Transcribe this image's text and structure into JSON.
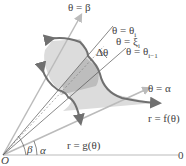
{
  "labels": {
    "theta_beta": "θ = β",
    "theta_i": "θ = θ",
    "theta_i_sub": "i",
    "theta_xi": "θ = ξ",
    "theta_xi_sub": "i",
    "delta_theta": "Δθ",
    "theta_im1": "θ = θ",
    "theta_im1_sub": "i−1",
    "theta_alpha": "θ = α",
    "r_f": "r = f(θ)",
    "r_g": "r = g(θ)",
    "origin": "O",
    "polar_axis": "0",
    "beta": "β",
    "alpha": "α"
  },
  "colors": {
    "region_fill": "#dcdcdc",
    "sector_fill": "#bdbdbd",
    "curve": "#707070",
    "ray": "#bbbbbb",
    "line": "#555555"
  }
}
